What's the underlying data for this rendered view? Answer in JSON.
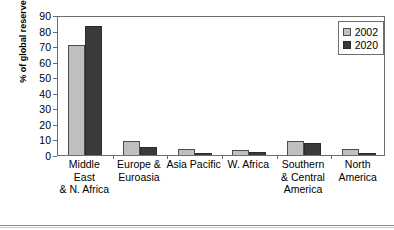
{
  "chart_data": {
    "type": "bar",
    "title": "",
    "subtitle": "",
    "xlabel": "",
    "ylabel": "% of global reserves",
    "ylim": [
      0,
      90
    ],
    "ytick_step": 10,
    "yticks": [
      0,
      10,
      20,
      30,
      40,
      50,
      60,
      70,
      80,
      90
    ],
    "grid": false,
    "legend_position": "top-right",
    "categories": [
      "Middle East\n& N. Africa",
      "Europe &\nEuroasia",
      "Asia Pacific",
      "W. Africa",
      "Southern\n& Central\nAmerica",
      "North\nAmerica"
    ],
    "category_lines": [
      [
        "Middle East",
        "& N. Africa"
      ],
      [
        "Europe &",
        "Euroasia"
      ],
      [
        "Asia Pacific"
      ],
      [
        "W. Africa"
      ],
      [
        "Southern",
        "& Central",
        "America"
      ],
      [
        "North",
        "America"
      ]
    ],
    "series": [
      {
        "name": "2002",
        "color": "#bfbfbf",
        "values": [
          71,
          9,
          4,
          3,
          9,
          4
        ]
      },
      {
        "name": "2020",
        "color": "#3a3a3a",
        "values": [
          83,
          5,
          1,
          2,
          8,
          1
        ]
      }
    ]
  },
  "legend": {
    "items": [
      {
        "label": "2002",
        "swatch": "light-gray-swatch"
      },
      {
        "label": "2020",
        "swatch": "dark-gray-swatch"
      }
    ]
  }
}
